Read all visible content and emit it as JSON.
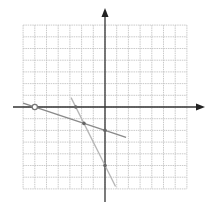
{
  "chart_data": {
    "type": "line",
    "title": "",
    "xlabel": "",
    "ylabel": "",
    "grid": true,
    "xlim": [
      -7,
      7
    ],
    "ylim": [
      -7,
      7
    ],
    "grid_step": 1,
    "axes": {
      "x_arrow": true,
      "y_arrow": true
    },
    "series": [
      {
        "name": "line-1",
        "equation": "y = -x/3 - 2",
        "points": [
          [
            -7,
            0.33
          ],
          [
            1.8,
            -2.6
          ]
        ],
        "color": "#8a8a8a"
      },
      {
        "name": "line-2",
        "equation": "y = -2x - 5",
        "points": [
          [
            -2.9,
            0.8
          ],
          [
            0.9,
            -6.8
          ]
        ],
        "color": "#b5b5b5"
      }
    ],
    "marked_points": [
      {
        "label": "x-intercept-line-1",
        "x": -6,
        "y": 0,
        "style": "open-circle"
      },
      {
        "label": "x-intercept-line-2",
        "x": -2.5,
        "y": 0,
        "style": "dot"
      },
      {
        "label": "intersection",
        "x": -1.8,
        "y": -1.4,
        "style": "dot"
      },
      {
        "label": "y-intercept-line-1",
        "x": 0,
        "y": -2,
        "style": "dot"
      },
      {
        "label": "y-intercept-line-2",
        "x": 0,
        "y": -5,
        "style": "dot"
      }
    ]
  },
  "colors": {
    "grid": "#c4c4c4",
    "axis": "#333333",
    "background": "#ffffff"
  }
}
